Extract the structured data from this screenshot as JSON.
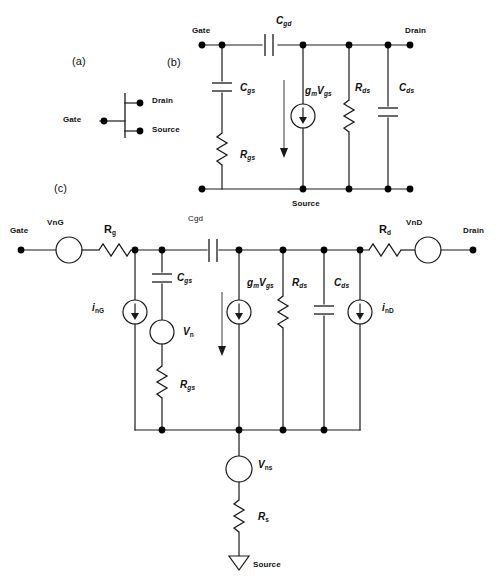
{
  "figure": {
    "panels": [
      {
        "id": "a",
        "label": "(a)",
        "x": 72,
        "y": 56
      },
      {
        "id": "b",
        "label": "(b)",
        "x": 167,
        "y": 57
      },
      {
        "id": "c",
        "label": "(c)",
        "x": 54,
        "y": 183
      }
    ]
  },
  "panel_a": {
    "terminals": [
      {
        "name": "gate",
        "label": "Gate",
        "x": 63,
        "y": 116
      },
      {
        "name": "drain",
        "label": "Drain",
        "x": 152,
        "y": 97
      },
      {
        "name": "source",
        "label": "Source",
        "x": 152,
        "y": 126
      }
    ]
  },
  "panel_b": {
    "terminals": [
      {
        "name": "gate",
        "label": "Gate",
        "x": 192,
        "y": 27
      },
      {
        "name": "drain",
        "label": "Drain",
        "x": 405,
        "y": 27
      },
      {
        "name": "source",
        "label": "Source",
        "x": 292,
        "y": 200
      }
    ],
    "components": [
      {
        "name": "cgd",
        "base": "C",
        "sub": "gd",
        "x": 276,
        "y": 16
      },
      {
        "name": "cgs",
        "base": "C",
        "sub": "gs",
        "x": 240,
        "y": 83
      },
      {
        "name": "gm-vgs",
        "base": "g",
        "sub": "m",
        "base2": "V",
        "sub2": "gs",
        "x": 305,
        "y": 86
      },
      {
        "name": "rds",
        "base": "R",
        "sub": "ds",
        "x": 355,
        "y": 83
      },
      {
        "name": "cds",
        "base": "C",
        "sub": "ds",
        "x": 399,
        "y": 83
      },
      {
        "name": "rgs",
        "base": "R",
        "sub": "gs",
        "x": 240,
        "y": 150
      }
    ]
  },
  "panel_c": {
    "terminals": [
      {
        "name": "gate",
        "label": "Gate",
        "x": 10,
        "y": 227
      },
      {
        "name": "drain",
        "label": "Drain",
        "x": 463,
        "y": 227
      },
      {
        "name": "source",
        "label": "Source",
        "x": 253,
        "y": 561
      }
    ],
    "noise_sources": [
      {
        "name": "vng",
        "label": "VnG",
        "x": 47,
        "y": 219
      },
      {
        "name": "vnd",
        "label": "VnD",
        "x": 406,
        "y": 219
      }
    ],
    "components": [
      {
        "name": "rg",
        "base": "R",
        "sub": "g",
        "x": 104,
        "y": 224
      },
      {
        "name": "cgd",
        "label": "Cgd",
        "x": 188,
        "y": 215
      },
      {
        "name": "rd",
        "base": "R",
        "sub": "d",
        "x": 379,
        "y": 224
      },
      {
        "name": "ing",
        "base": "i",
        "sub": "nG",
        "x": 92,
        "y": 303
      },
      {
        "name": "cgs",
        "base": "C",
        "sub": "gs",
        "x": 177,
        "y": 273
      },
      {
        "name": "vn",
        "base": "V",
        "sub": "n",
        "x": 183,
        "y": 327
      },
      {
        "name": "gm-vgs",
        "base": "g",
        "sub": "m",
        "base2": "V",
        "sub2": "gs",
        "x": 247,
        "y": 278
      },
      {
        "name": "rds",
        "base": "R",
        "sub": "ds",
        "x": 292,
        "y": 278
      },
      {
        "name": "cds",
        "base": "C",
        "sub": "ds",
        "x": 334,
        "y": 278
      },
      {
        "name": "ind",
        "base": "i",
        "sub": "nD",
        "x": 382,
        "y": 303
      },
      {
        "name": "rgs",
        "base": "R",
        "sub": "gs",
        "x": 180,
        "y": 380
      },
      {
        "name": "vns",
        "base": "V",
        "sub": "ns",
        "x": 258,
        "y": 460
      },
      {
        "name": "rs",
        "base": "R",
        "sub": "s",
        "x": 258,
        "y": 512
      }
    ]
  },
  "colors": {
    "stroke": "#1a1a1a",
    "node": "#000000",
    "background": "#ffffff",
    "text": "#111111"
  }
}
